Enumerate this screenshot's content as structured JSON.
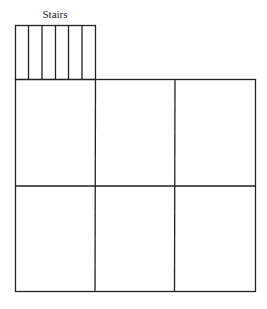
{
  "diagram": {
    "stairs_label": "Stairs",
    "stairs_treads": 6,
    "grid": {
      "rows": 2,
      "cols": 3
    },
    "line_color": "#222222"
  }
}
